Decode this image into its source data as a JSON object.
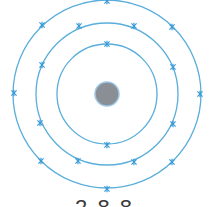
{
  "diagram": {
    "type": "bohr-model",
    "colors": {
      "shell": "#5aaedb",
      "electron": "#3a9ad6",
      "nucleus": "#8a8f96",
      "nucleus_edge": "#9cc6e4"
    },
    "center": [
      107,
      94
    ],
    "nucleus_radius": 12,
    "shells": [
      {
        "radius": 50,
        "electrons": [
          [
            107,
            44
          ],
          [
            107,
            145
          ]
        ]
      },
      {
        "radius": 71,
        "electrons": [
          [
            79,
            26
          ],
          [
            134,
            26
          ],
          [
            173,
            67
          ],
          [
            173,
            124
          ],
          [
            134,
            162
          ],
          [
            78,
            161
          ],
          [
            40,
            123
          ],
          [
            42,
            65
          ]
        ]
      },
      {
        "radius": 94,
        "electrons": [
          [
            107,
            1
          ],
          [
            42,
            25
          ],
          [
            172,
            27
          ],
          [
            14,
            93
          ],
          [
            200,
            94
          ],
          [
            41,
            161
          ],
          [
            172,
            162
          ],
          [
            107,
            189
          ]
        ]
      }
    ],
    "configuration_label": "2.8.8"
  }
}
